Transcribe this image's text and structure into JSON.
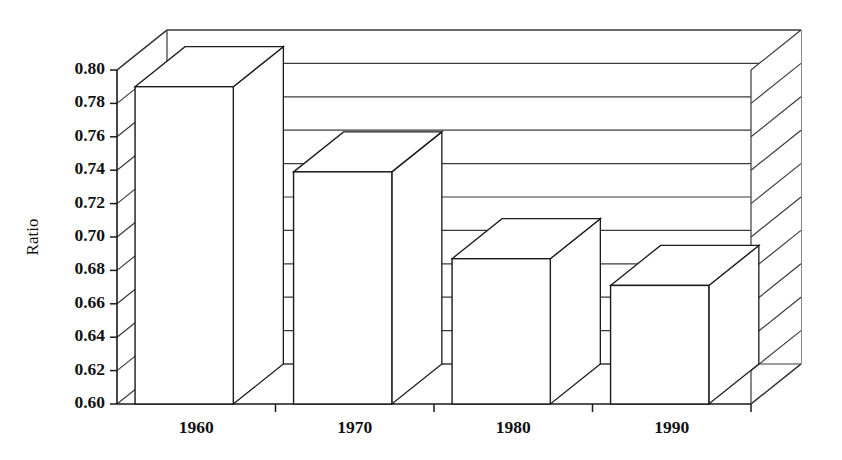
{
  "chart_data": {
    "type": "bar",
    "title": "",
    "subtitle": "",
    "xlabel": "",
    "ylabel": "Ratio",
    "categories": [
      "1960",
      "1970",
      "1980",
      "1990"
    ],
    "values": [
      0.79,
      0.739,
      0.687,
      0.671
    ],
    "series": [
      {
        "name": "Ratio",
        "values": [
          0.79,
          0.739,
          0.687,
          0.671
        ]
      }
    ],
    "ylim": [
      0.6,
      0.8
    ],
    "ytick_labels": [
      "0.80",
      "0.78",
      "0.76",
      "0.74",
      "0.72",
      "0.70",
      "0.68",
      "0.66",
      "0.64",
      "0.62",
      "0.60"
    ],
    "ytick_values": [
      0.8,
      0.78,
      0.76,
      0.74,
      0.72,
      0.7,
      0.68,
      0.66,
      0.64,
      0.62,
      0.6
    ],
    "xtick_labels": [
      "1960",
      "1970",
      "1980",
      "1990"
    ],
    "grid": true,
    "grid_orientation": "horizontal",
    "legend": null,
    "legend_position": "none",
    "style": "3d-column",
    "annotations": [],
    "colors": {
      "bar_fill": "#ffffff",
      "bar_stroke": "#1a1a1a",
      "axis": "#1a1a1a",
      "grid": "#3a3a3a",
      "background": "#ffffff",
      "text": "#111111"
    }
  },
  "axis": {
    "y_title": "Ratio"
  }
}
